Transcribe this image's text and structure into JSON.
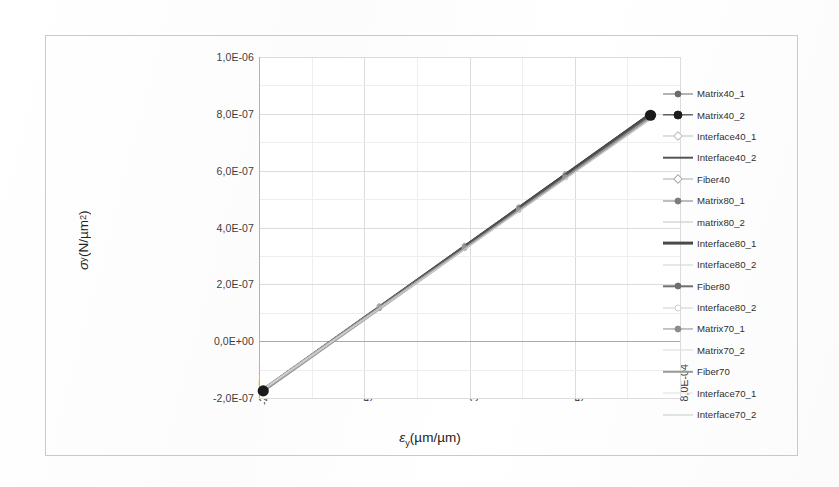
{
  "chart_data": {
    "type": "line",
    "title": "",
    "xlabel": "εy (µm/µm)",
    "ylabel": "σy (N/µm²)",
    "xlabel_parts": {
      "sym": "ε",
      "sub": "y",
      "unit": "(µm/µm)"
    },
    "ylabel_parts": {
      "sym": "σ",
      "sub": "y",
      "unit": "(N/µm",
      "sup": "2",
      "unit_end": ")"
    },
    "x_tick_labels": [
      "-2,0E-04",
      "5,0E-05",
      "3,0E-04",
      "5,5E-04",
      "8,0E-04"
    ],
    "x_tick_values": [
      -0.0002,
      5e-05,
      0.0003,
      0.00055,
      0.0008
    ],
    "y_tick_labels": [
      "1,0E-06",
      "8,0E-07",
      "6,0E-07",
      "4,0E-07",
      "2,0E-07",
      "0,0E+00",
      "-2,0E-07"
    ],
    "y_tick_values": [
      1e-06,
      8e-07,
      6e-07,
      4e-07,
      2e-07,
      0.0,
      -2e-07
    ],
    "xlim": [
      -0.0002,
      0.0008
    ],
    "ylim": [
      -2e-07,
      1e-06
    ],
    "grid": true,
    "legend_position": "right",
    "endpoint_markers": [
      {
        "x": -0.00019,
        "y": -1.75e-07,
        "label": "lower-left-endpoint"
      },
      {
        "x": 0.00073,
        "y": 7.95e-07,
        "label": "upper-right-endpoint"
      }
    ],
    "note": "All 16 series are nearly coincident straight lines (linear elastic response) from about (-1.9E-04, -1.75E-07) to (7.3E-04, 7.95E-07); slope about 1.06E-03 N/µm² per unit strain.",
    "series": [
      {
        "name": "Matrix40_1",
        "color": "#6b6b6b",
        "marker": "dot",
        "width": 1.0,
        "x": [
          -0.00019,
          0.00073
        ],
        "values": [
          -1.75e-07,
          7.95e-07
        ]
      },
      {
        "name": "Matrix40_2",
        "color": "#1d1d1d",
        "marker": "bigdot",
        "width": 1.3,
        "x": [
          -0.00019,
          0.00073
        ],
        "values": [
          -1.76e-07,
          7.96e-07
        ]
      },
      {
        "name": "Interface40_1",
        "color": "#bdbdbd",
        "marker": "diamond",
        "width": 1.0,
        "x": [
          -0.00019,
          0.00073
        ],
        "values": [
          -1.72e-07,
          7.92e-07
        ]
      },
      {
        "name": "Interface40_2",
        "color": "#555555",
        "marker": "thick",
        "width": 2.6,
        "x": [
          -0.00019,
          0.00073
        ],
        "values": [
          -1.74e-07,
          7.93e-07
        ]
      },
      {
        "name": "Fiber40",
        "color": "#a9a9a9",
        "marker": "diamond",
        "width": 1.0,
        "x": [
          -0.00019,
          0.00073
        ],
        "values": [
          -1.7e-07,
          7.9e-07
        ]
      },
      {
        "name": "Matrix80_1",
        "color": "#7d7d7d",
        "marker": "dot",
        "width": 1.0,
        "x": [
          -0.00019,
          0.00073
        ],
        "values": [
          -1.73e-07,
          7.94e-07
        ]
      },
      {
        "name": "matrix80_2",
        "color": "#c4c4c4",
        "marker": "none",
        "width": 1.0,
        "x": [
          -0.00019,
          0.00073
        ],
        "values": [
          -1.69e-07,
          7.89e-07
        ]
      },
      {
        "name": "Interface80_1",
        "color": "#4a4a4a",
        "marker": "thick",
        "width": 2.8,
        "x": [
          -0.00019,
          0.00073
        ],
        "values": [
          -1.75e-07,
          7.95e-07
        ]
      },
      {
        "name": "Interface80_2",
        "color": "#d2d2d2",
        "marker": "none",
        "width": 1.0,
        "x": [
          -0.00019,
          0.00073
        ],
        "values": [
          -1.67e-07,
          7.87e-07
        ]
      },
      {
        "name": "Fiber80",
        "color": "#6f6f6f",
        "marker": "dot",
        "width": 1.4,
        "x": [
          -0.00019,
          0.00073
        ],
        "values": [
          -1.74e-07,
          7.93e-07
        ]
      },
      {
        "name": "Interface80_2",
        "color": "#cfcfcf",
        "marker": "circle",
        "width": 1.0,
        "x": [
          -0.00019,
          0.00073
        ],
        "values": [
          -1.68e-07,
          7.88e-07
        ]
      },
      {
        "name": "Matrix70_1",
        "color": "#8c8c8c",
        "marker": "dot",
        "width": 1.1,
        "x": [
          -0.00019,
          0.00073
        ],
        "values": [
          -1.71e-07,
          7.91e-07
        ]
      },
      {
        "name": "Matrix70_2",
        "color": "#dadada",
        "marker": "none",
        "width": 1.0,
        "x": [
          -0.00019,
          0.00073
        ],
        "values": [
          -1.66e-07,
          7.86e-07
        ]
      },
      {
        "name": "Fiber70",
        "color": "#9b9b9b",
        "marker": "thick",
        "width": 2.0,
        "x": [
          -0.00019,
          0.00073
        ],
        "values": [
          -1.72e-07,
          7.92e-07
        ]
      },
      {
        "name": "Interface70_1",
        "color": "#e0e0e0",
        "marker": "none",
        "width": 1.0,
        "x": [
          -0.00019,
          0.00073
        ],
        "values": [
          -1.65e-07,
          7.85e-07
        ]
      },
      {
        "name": "Interface70_2",
        "color": "#c8c8c8",
        "marker": "line",
        "width": 1.0,
        "x": [
          -0.00019,
          0.00073
        ],
        "values": [
          -1.67e-07,
          7.87e-07
        ]
      }
    ]
  },
  "legend": {
    "items": [
      {
        "label": "Matrix40_1"
      },
      {
        "label": "Matrix40_2"
      },
      {
        "label": "Interface40_1"
      },
      {
        "label": "Interface40_2"
      },
      {
        "label": "Fiber40"
      },
      {
        "label": "Matrix80_1"
      },
      {
        "label": "matrix80_2"
      },
      {
        "label": "Interface80_1"
      },
      {
        "label": "Interface80_2"
      },
      {
        "label": "Fiber80"
      },
      {
        "label": "Interface80_2"
      },
      {
        "label": "Matrix70_1"
      },
      {
        "label": "Matrix70_2"
      },
      {
        "label": "Fiber70"
      },
      {
        "label": "Interface70_1"
      },
      {
        "label": "Interface70_2"
      }
    ]
  },
  "colors": {
    "plot_background": "#ffffff",
    "grid_major": "#dcdcdc",
    "grid_minor": "#eeeeee",
    "axis_line": "#aaaaaa",
    "frame": "#c9c9c9",
    "endpoint_marker": "#1a1a1a",
    "text": "#3a3a3a"
  }
}
